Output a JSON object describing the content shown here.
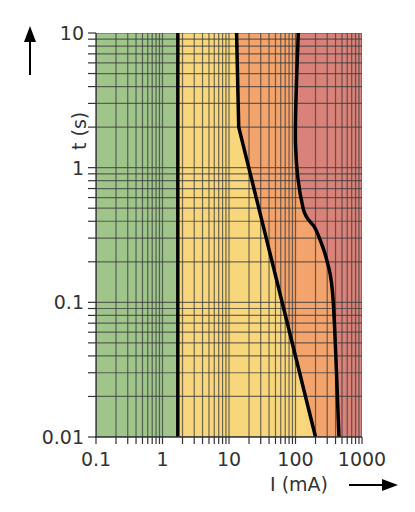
{
  "chart_data": {
    "type": "line",
    "title": "",
    "xlabel": "I (mA)",
    "ylabel": "t (s)",
    "xscale": "log",
    "yscale": "log",
    "xlim": [
      0.1,
      1000
    ],
    "ylim": [
      0.01,
      10
    ],
    "x_tick_labels": [
      "0.1",
      "1",
      "10",
      "100",
      "1000"
    ],
    "y_tick_labels": [
      "0.01",
      "0.1",
      "1",
      "10"
    ],
    "grid": true,
    "legend": null,
    "zones": [
      {
        "name": "zone-1",
        "color": "#9fc58b",
        "x_from": 0.1,
        "x_to": 1.7
      },
      {
        "name": "zone-2",
        "color": "#f8d77c",
        "boundary": "between 1.7 mA line and curve c1"
      },
      {
        "name": "zone-3",
        "color": "#f3a36c",
        "boundary": "between curve c1 and curve c2"
      },
      {
        "name": "zone-4",
        "color": "#d9827a",
        "boundary": "right of curve c2"
      }
    ],
    "series": [
      {
        "name": "boundary-a",
        "points": [
          [
            1.7,
            10
          ],
          [
            1.7,
            0.01
          ]
        ]
      },
      {
        "name": "boundary-c1",
        "points": [
          [
            13,
            10
          ],
          [
            14,
            2
          ],
          [
            200,
            0.01
          ]
        ]
      },
      {
        "name": "boundary-c2",
        "points": [
          [
            110,
            10
          ],
          [
            100,
            1.5
          ],
          [
            130,
            0.5
          ],
          [
            200,
            0.35
          ],
          [
            300,
            0.2
          ],
          [
            370,
            0.1
          ],
          [
            450,
            0.01
          ]
        ]
      }
    ]
  },
  "axes": {
    "x_title": "I (mA)",
    "y_title": "t (s)"
  }
}
